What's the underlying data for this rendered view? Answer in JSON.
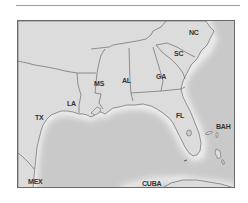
{
  "map": {
    "title": "",
    "region": "Southeastern United States and Gulf of Mexico",
    "colors": {
      "land": "#dcdcdc",
      "water": "#c9c9c9",
      "coast_glow": "#f4f4f4",
      "border": "#6a6a6a",
      "label": "#333333"
    },
    "labels": [
      {
        "id": "nc",
        "text": "NC",
        "x": 188,
        "y": 28
      },
      {
        "id": "sc",
        "text": "SC",
        "x": 173,
        "y": 49
      },
      {
        "id": "ga",
        "text": "GA",
        "x": 155,
        "y": 72
      },
      {
        "id": "al",
        "text": "AL",
        "x": 121,
        "y": 76
      },
      {
        "id": "ms",
        "text": "MS",
        "x": 93,
        "y": 79
      },
      {
        "id": "la",
        "text": "LA",
        "x": 66,
        "y": 99
      },
      {
        "id": "tx",
        "text": "TX",
        "x": 34,
        "y": 113
      },
      {
        "id": "fl",
        "text": "FL",
        "x": 175,
        "y": 111
      },
      {
        "id": "bah",
        "text": "BAH",
        "x": 215,
        "y": 122
      },
      {
        "id": "mex",
        "text": "MEX",
        "x": 27,
        "y": 177
      },
      {
        "id": "cuba",
        "text": "CUBA",
        "x": 141,
        "y": 179
      }
    ]
  }
}
